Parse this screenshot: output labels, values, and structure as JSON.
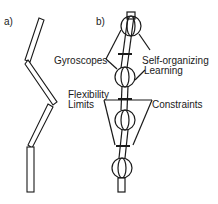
{
  "panels": {
    "a": {
      "label": "a)"
    },
    "b": {
      "label": "b)"
    }
  },
  "labels": {
    "gyroscopes": "Gyroscopes",
    "self_organizing_1": "Self-organizing",
    "self_organizing_2": "Learning",
    "flexibility_1": "Flexibility",
    "flexibility_2": "Limits",
    "constraints": "Constraints"
  },
  "colors": {
    "stroke": "#1a1a1a",
    "background": "#ffffff"
  }
}
